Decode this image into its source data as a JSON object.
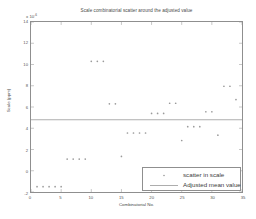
{
  "chart_data": {
    "type": "scatter",
    "title": "Scale combinatorial scatter  around the adjusted value",
    "xlabel": "Combinatorial No.",
    "ylabel": "Scale (ppm)",
    "y_exponent_label": "x 10",
    "y_exponent_power": "-6",
    "xlim": [
      0,
      35
    ],
    "ylim": [
      -2,
      14
    ],
    "xticks": [
      0,
      5,
      10,
      15,
      20,
      25,
      30,
      35
    ],
    "xtick_labels": [
      "0",
      "5",
      "10",
      "15",
      "20",
      "25",
      "30",
      "35"
    ],
    "yticks": [
      -2,
      0,
      2,
      4,
      6,
      8,
      10,
      12,
      14
    ],
    "ytick_labels": [
      "-2",
      "0",
      "2",
      "4",
      "6",
      "8",
      "10",
      "12",
      "14"
    ],
    "grid": false,
    "legend_position": "lower-right",
    "series": [
      {
        "name": "scatter in scale",
        "marker": "dot",
        "color": "#9a9a9a",
        "points": [
          {
            "x": 1,
            "y": -1.5
          },
          {
            "x": 2,
            "y": -1.5
          },
          {
            "x": 3,
            "y": -1.5
          },
          {
            "x": 4,
            "y": -1.5
          },
          {
            "x": 5,
            "y": -1.5
          },
          {
            "x": 6,
            "y": 1.1
          },
          {
            "x": 7,
            "y": 1.1
          },
          {
            "x": 8,
            "y": 1.1
          },
          {
            "x": 9,
            "y": 1.1
          },
          {
            "x": 10,
            "y": 10.3
          },
          {
            "x": 11,
            "y": 10.3
          },
          {
            "x": 12,
            "y": 10.3
          },
          {
            "x": 13,
            "y": 6.3
          },
          {
            "x": 14,
            "y": 6.3
          },
          {
            "x": 15,
            "y": 1.35
          },
          {
            "x": 16,
            "y": 3.55
          },
          {
            "x": 17,
            "y": 3.55
          },
          {
            "x": 18,
            "y": 3.55
          },
          {
            "x": 19,
            "y": 3.55
          },
          {
            "x": 20,
            "y": 5.4
          },
          {
            "x": 21,
            "y": 5.4
          },
          {
            "x": 22,
            "y": 5.4
          },
          {
            "x": 23,
            "y": 6.35
          },
          {
            "x": 24,
            "y": 6.35
          },
          {
            "x": 25,
            "y": 2.85
          },
          {
            "x": 26,
            "y": 4.15
          },
          {
            "x": 27,
            "y": 4.15
          },
          {
            "x": 28,
            "y": 4.15
          },
          {
            "x": 29,
            "y": 5.55
          },
          {
            "x": 30,
            "y": 5.55
          },
          {
            "x": 31,
            "y": 3.35
          },
          {
            "x": 32,
            "y": 7.95
          },
          {
            "x": 33,
            "y": 7.95
          },
          {
            "x": 34,
            "y": 6.7
          }
        ]
      },
      {
        "name": "Adjusted mean value",
        "marker": "line",
        "color": "#8a8a8a",
        "constant_y": 4.8
      }
    ]
  },
  "legend": {
    "entries": [
      {
        "label": "scatter in scale"
      },
      {
        "label": "Adjusted mean value"
      }
    ]
  }
}
